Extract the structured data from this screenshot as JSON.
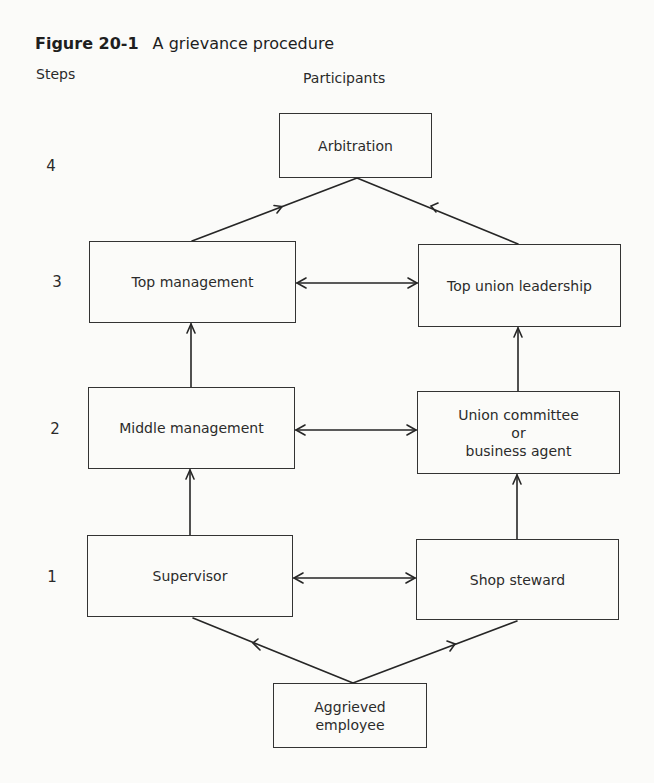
{
  "figure": {
    "number": "Figure 20-1",
    "caption": "A grievance procedure"
  },
  "headers": {
    "steps": "Steps",
    "participants": "Participants"
  },
  "steps": [
    "1",
    "2",
    "3",
    "4"
  ],
  "nodes": {
    "arbitration": "Arbitration",
    "top_management": "Top management",
    "top_union_leadership": "Top union leadership",
    "middle_management": "Middle management",
    "union_committee_line1": "Union committee",
    "union_committee_line2": "or",
    "union_committee_line3": "business agent",
    "supervisor": "Supervisor",
    "shop_steward": "Shop steward",
    "aggrieved_line1": "Aggrieved",
    "aggrieved_line2": "employee"
  },
  "edges": [
    {
      "from": "Aggrieved employee",
      "to": "Supervisor",
      "type": "directed"
    },
    {
      "from": "Aggrieved employee",
      "to": "Shop steward",
      "type": "directed"
    },
    {
      "from": "Supervisor",
      "to": "Shop steward",
      "type": "bidirectional"
    },
    {
      "from": "Supervisor",
      "to": "Middle management",
      "type": "directed"
    },
    {
      "from": "Shop steward",
      "to": "Union committee or business agent",
      "type": "directed"
    },
    {
      "from": "Middle management",
      "to": "Union committee or business agent",
      "type": "bidirectional"
    },
    {
      "from": "Middle management",
      "to": "Top management",
      "type": "directed"
    },
    {
      "from": "Union committee or business agent",
      "to": "Top union leadership",
      "type": "directed"
    },
    {
      "from": "Top management",
      "to": "Top union leadership",
      "type": "bidirectional"
    },
    {
      "from": "Top management",
      "to": "Arbitration",
      "type": "directed"
    },
    {
      "from": "Top union leadership",
      "to": "Arbitration",
      "type": "directed"
    }
  ]
}
